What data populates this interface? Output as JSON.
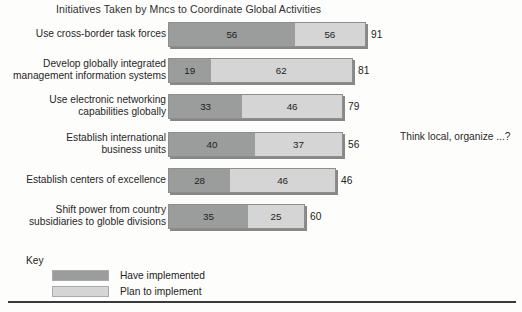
{
  "chart_data": {
    "type": "bar",
    "subtype": "stacked-horizontal",
    "title": "Initiatives Taken by Mncs to Coordinate Global Activities",
    "xlabel": "",
    "ylabel": "",
    "grid": false,
    "legend_position": "bottom-left",
    "legend_title": "Key",
    "annotation": "Think local, organize ...?",
    "categories": [
      "Use cross-border task forces",
      "Develop globally integrated\nmanagement information systems",
      "Use electronic networking\ncapabilities globally",
      "Establish international\nbusiness units",
      "Establish centers of excellence",
      "Shift power from country\nsubsidiaries to globle divisions"
    ],
    "series": [
      {
        "name": "Have implemented",
        "color": "#9b9d9c",
        "values": [
          56,
          19,
          33,
          40,
          28,
          35
        ]
      },
      {
        "name": "Plan to implement",
        "color": "#d4d5d4",
        "values": [
          56,
          62,
          46,
          37,
          46,
          25
        ]
      }
    ],
    "end_labels": [
      "91",
      "81",
      "79",
      "56",
      "46",
      "60"
    ]
  },
  "bars": [
    {
      "label": "Use cross-border task forces",
      "dark_value": "56",
      "light_value": "56",
      "total_label": "91",
      "dark_px": 127,
      "light_px": 71,
      "label_top": 3,
      "row_top": 0
    },
    {
      "label": "Develop globally integrated\nmanagement information systems",
      "dark_value": "19",
      "light_value": "62",
      "total_label": "81",
      "dark_px": 42,
      "light_px": 143,
      "label_top": -3,
      "row_top": 36
    },
    {
      "label": "Use electronic networking\ncapabilities globally",
      "dark_value": "33",
      "light_value": "46",
      "total_label": "79",
      "dark_px": 74,
      "light_px": 101,
      "label_top": -3,
      "row_top": 72
    },
    {
      "label": "Establish international\nbusiness units",
      "dark_value": "40",
      "light_value": "37",
      "total_label": "56",
      "dark_px": 87,
      "light_px": 88,
      "label_top": -3,
      "row_top": 110
    },
    {
      "label": "Establish centers of excellence",
      "dark_value": "28",
      "light_value": "46",
      "total_label": "46",
      "dark_px": 62,
      "light_px": 106,
      "label_top": 3,
      "row_top": 146
    },
    {
      "label": "Shift power from country\nsubsidiaries to globle divisions",
      "dark_value": "35",
      "light_value": "25",
      "total_label": "60",
      "dark_px": 80,
      "light_px": 57,
      "label_top": -3,
      "row_top": 182
    }
  ],
  "key": {
    "title": "Key",
    "items": [
      {
        "label": "Have implemented",
        "color": "#9b9d9c"
      },
      {
        "label": "Plan to implement",
        "color": "#d4d5d4"
      }
    ]
  },
  "annotation": {
    "text": "Think local, organize ...?"
  },
  "colors": {
    "have_implemented": "#9b9d9c",
    "plan_to_implement": "#d4d5d4",
    "bar_border": "#8d8f8e",
    "text": "#262626",
    "rule": "#3a3a3a",
    "background": "#fdfdfc"
  }
}
